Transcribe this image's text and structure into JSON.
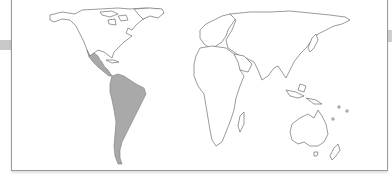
{
  "map": {
    "projection": "equal-area world map",
    "highlighted_region": "Latin America",
    "highlighted_areas": [
      "Mexico",
      "Central America",
      "South America"
    ],
    "colors": {
      "highlight_fill": "#a9a9a9",
      "outline": "#6e6e6e",
      "background": "#ffffff",
      "frame": "#9a9a9a"
    }
  }
}
